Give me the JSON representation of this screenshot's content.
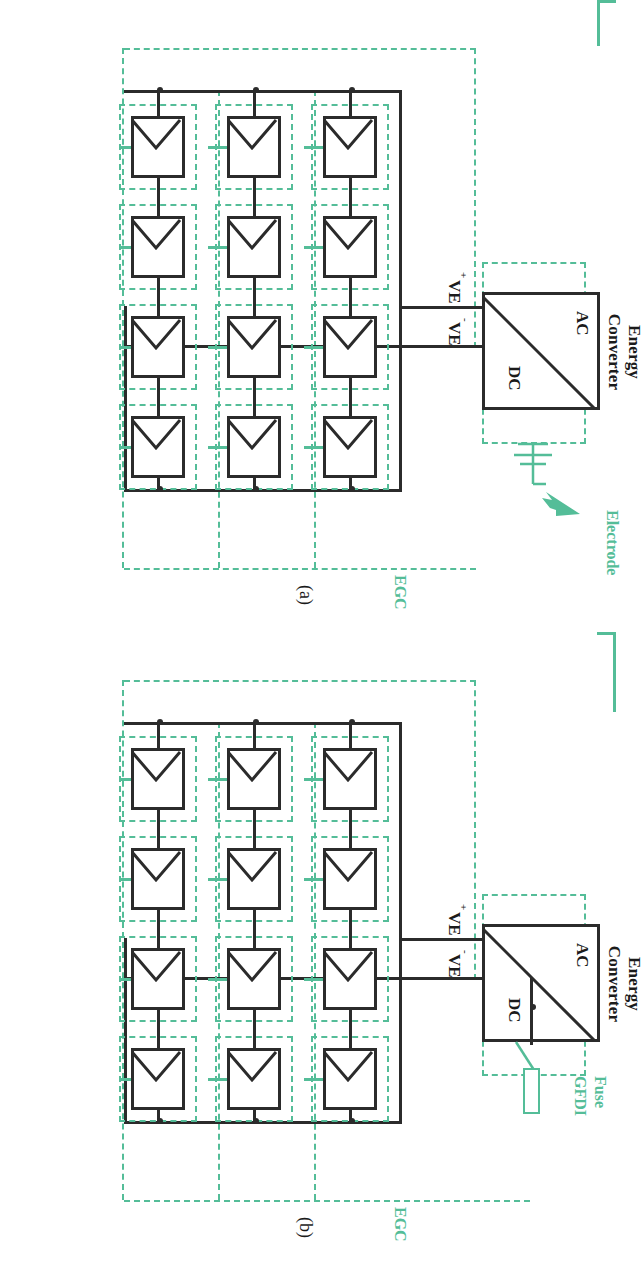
{
  "figure": {
    "kind": "electrical one-line diagram",
    "accent_green": "#54bd98",
    "line_black": "#2b2b2b",
    "panels": [
      {
        "id": "a",
        "panel_label": "(a)",
        "converter": {
          "title_line1": "Energy",
          "title_line2": "Converter",
          "ac_label": "AC",
          "dc_label": "DC",
          "pos_terminal": "VE",
          "pos_sign": "+",
          "neg_terminal": "VE",
          "neg_sign": "-"
        },
        "egc_label": "EGC",
        "ground": {
          "label": "Electrode",
          "symbol": "earth-electrode"
        },
        "array": {
          "strings": 3,
          "modules_per_string": 4,
          "module_symbol": "pv-module"
        }
      },
      {
        "id": "b",
        "panel_label": "(b)",
        "converter": {
          "title_line1": "Energy",
          "title_line2": "Converter",
          "ac_label": "AC",
          "dc_label": "DC",
          "pos_terminal": "VE",
          "pos_sign": "+",
          "neg_terminal": "VE",
          "neg_sign": "-"
        },
        "egc_label": "EGC",
        "protection": {
          "line1": "Fuse",
          "line2": "GFDI",
          "symbol": "fuse-and-switch"
        },
        "array": {
          "strings": 3,
          "modules_per_string": 4,
          "module_symbol": "pv-module"
        }
      }
    ]
  }
}
